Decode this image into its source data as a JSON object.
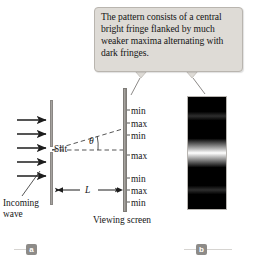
{
  "figure": {
    "callout": {
      "text": "The pattern consists of a central bright fringe flanked by much weaker maxima alternating with dark fringes."
    },
    "labels": {
      "slit": "Slit",
      "incoming_wave_line1": "Incoming",
      "incoming_wave_line2": "wave",
      "distance_L": "L",
      "angle_theta": "θ",
      "viewing_screen": "Viewing screen"
    },
    "fringe_labels": [
      {
        "text": "min",
        "y": 106
      },
      {
        "text": "max",
        "y": 119
      },
      {
        "text": "min",
        "y": 131
      },
      {
        "text": "max",
        "y": 151
      },
      {
        "text": "min",
        "y": 174
      },
      {
        "text": "max",
        "y": 186
      },
      {
        "text": "min",
        "y": 198
      }
    ],
    "panel_tags": {
      "a": "a",
      "b": "b"
    },
    "colors": {
      "callout_fill": "#dedbd6",
      "callout_border": "#b9b5af",
      "bar_gray": "#97948f",
      "tag_gray": "#8d8b88",
      "photo_dark": "#050505",
      "text": "#161616"
    },
    "counts": {
      "incoming_arrows": 5
    }
  },
  "chart_data": {
    "type": "line",
    "xlabel": "Position on screen",
    "ylabel": "Relative intensity",
    "series": [
      {
        "name": "Intensity",
        "points": [
          {
            "position": "min",
            "intensity": 0.0
          },
          {
            "position": "max",
            "intensity": 0.017
          },
          {
            "position": "min",
            "intensity": 0.0
          },
          {
            "position": "max",
            "intensity": 1.0
          },
          {
            "position": "min",
            "intensity": 0.0
          },
          {
            "position": "max",
            "intensity": 0.017
          },
          {
            "position": "min",
            "intensity": 0.0
          }
        ]
      }
    ],
    "annotations": [
      "central bright fringe",
      "weaker secondary maxima",
      "dark fringes"
    ]
  }
}
